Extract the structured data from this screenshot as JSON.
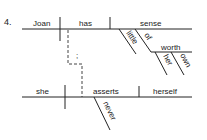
{
  "diagram": {
    "number": "4.",
    "clause1": {
      "subject": "Joan",
      "verb": "has",
      "object": "sense",
      "modifiers": {
        "adjective": "little",
        "preposition": "of",
        "prep_object": "worth",
        "prep_object_modifiers": [
          "her",
          "own"
        ]
      }
    },
    "connector": {
      "style": "dashed",
      "label": ";"
    },
    "clause2": {
      "subject": "she",
      "verb": "asserts",
      "object": "herself",
      "modifiers": {
        "adverb": "never"
      }
    }
  }
}
